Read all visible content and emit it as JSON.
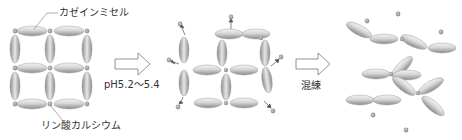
{
  "diagram": {
    "colors": {
      "micelle_light": "#f2f2f2",
      "micelle_dark": "#8c8c8c",
      "micelle_stroke": "#9a9a9a",
      "calcium_phosphate": "#9a9a9a",
      "arrow_stroke": "#777777",
      "text": "#333333"
    },
    "stages": [
      {
        "id": "initial",
        "description": "Lattice of casein micelles joined by calcium phosphate bridges"
      },
      {
        "id": "acidified",
        "description": "Calcium phosphate released; lattice loosens"
      },
      {
        "id": "kneaded",
        "description": "Micelles realigned into fibrous chains"
      }
    ],
    "labels": {
      "casein_micelle": "カゼインミセル",
      "calcium_phosphate": "リン酸カルシウム",
      "step1_condition": "pH5.2〜5.4",
      "step2_condition": "混練"
    },
    "arrows": [
      {
        "from": "initial",
        "to": "acidified",
        "label_key": "step1_condition"
      },
      {
        "from": "acidified",
        "to": "kneaded",
        "label_key": "step2_condition"
      }
    ]
  }
}
